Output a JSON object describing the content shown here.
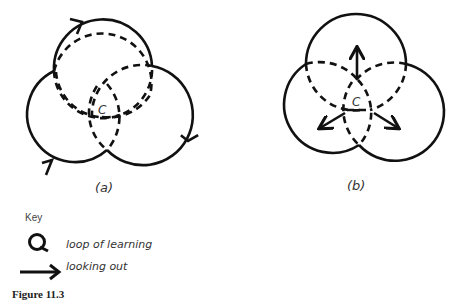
{
  "figure": {
    "caption": "Figure 11.3",
    "panels": [
      {
        "id": "a",
        "label": "(a)",
        "center_label": "C",
        "description": "Three overlapping circles with circulating arrows (loops of learning)"
      },
      {
        "id": "b",
        "label": "(b)",
        "center_label": "C",
        "description": "Three overlapping circles with three outward arrows from center (looking out)"
      }
    ],
    "key": {
      "title": "Key",
      "items": [
        {
          "icon": "loop-icon",
          "label": "loop of learning"
        },
        {
          "icon": "arrow-right-icon",
          "label": "looking out"
        }
      ]
    }
  }
}
